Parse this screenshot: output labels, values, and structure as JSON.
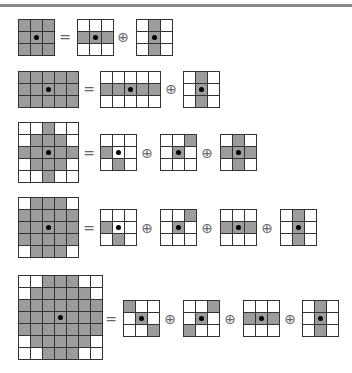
{
  "figure": {
    "colors": {
      "filled": "#9c9c9c",
      "empty": "#ffffff",
      "line": "#333333",
      "origin_dot": "#000000"
    },
    "operators": {
      "equals": "=",
      "dilation": "⊕"
    },
    "rows": [
      {
        "target": {
          "x": 18,
          "y": 19,
          "cols": 3,
          "rows": 3,
          "origin": [
            1,
            1
          ],
          "cells": [
            "111",
            "111",
            "111"
          ]
        },
        "equals_pos": [
          58,
          30
        ],
        "factors": [
          {
            "x": 77,
            "y": 19,
            "cols": 3,
            "rows": 3,
            "origin": [
              1,
              1
            ],
            "cells": [
              "000",
              "111",
              "000"
            ]
          },
          {
            "x": 136,
            "y": 19,
            "cols": 3,
            "rows": 3,
            "origin": [
              1,
              1
            ],
            "cells": [
              "010",
              "010",
              "010"
            ]
          }
        ],
        "op_pos": [
          [
            116,
            30
          ]
        ]
      },
      {
        "target": {
          "x": 18,
          "y": 71,
          "cols": 5,
          "rows": 3,
          "origin": [
            2,
            1
          ],
          "cells": [
            "11111",
            "11111",
            "11111"
          ]
        },
        "equals_pos": [
          82,
          82
        ],
        "factors": [
          {
            "x": 100,
            "y": 71,
            "cols": 5,
            "rows": 3,
            "origin": [
              2,
              1
            ],
            "cells": [
              "00000",
              "11111",
              "00000"
            ]
          },
          {
            "x": 183,
            "y": 71,
            "cols": 3,
            "rows": 3,
            "origin": [
              1,
              1
            ],
            "cells": [
              "010",
              "010",
              "010"
            ]
          }
        ],
        "op_pos": [
          [
            164,
            82
          ]
        ]
      },
      {
        "target": {
          "x": 18,
          "y": 122,
          "cols": 5,
          "rows": 5,
          "origin": [
            2,
            2
          ],
          "cells": [
            "00100",
            "01110",
            "11111",
            "01110",
            "00100"
          ]
        },
        "equals_pos": [
          82,
          146
        ],
        "factors": [
          {
            "x": 100,
            "y": 134,
            "cols": 3,
            "rows": 3,
            "origin": [
              1,
              1
            ],
            "cells": [
              "000",
              "100",
              "010"
            ],
            "origin_filled": false
          },
          {
            "x": 160,
            "y": 134,
            "cols": 3,
            "rows": 3,
            "origin": [
              1,
              1
            ],
            "cells": [
              "001",
              "010",
              "000"
            ]
          },
          {
            "x": 220,
            "y": 134,
            "cols": 3,
            "rows": 3,
            "origin": [
              1,
              1
            ],
            "cells": [
              "010",
              "111",
              "010"
            ]
          }
        ],
        "op_pos": [
          [
            140,
            146
          ],
          [
            200,
            146
          ]
        ]
      },
      {
        "target": {
          "x": 18,
          "y": 197,
          "cols": 5,
          "rows": 5,
          "origin": [
            2,
            2
          ],
          "cells": [
            "01110",
            "11111",
            "11111",
            "11111",
            "01110"
          ]
        },
        "equals_pos": [
          82,
          221
        ],
        "factors": [
          {
            "x": 100,
            "y": 209,
            "cols": 3,
            "rows": 3,
            "origin": [
              1,
              1
            ],
            "cells": [
              "000",
              "100",
              "010"
            ],
            "origin_filled": false
          },
          {
            "x": 160,
            "y": 209,
            "cols": 3,
            "rows": 3,
            "origin": [
              1,
              1
            ],
            "cells": [
              "001",
              "010",
              "000"
            ]
          },
          {
            "x": 220,
            "y": 209,
            "cols": 3,
            "rows": 3,
            "origin": [
              1,
              1
            ],
            "cells": [
              "000",
              "111",
              "000"
            ]
          },
          {
            "x": 280,
            "y": 209,
            "cols": 3,
            "rows": 3,
            "origin": [
              1,
              1
            ],
            "cells": [
              "010",
              "010",
              "010"
            ]
          }
        ],
        "op_pos": [
          [
            140,
            221
          ],
          [
            200,
            221
          ],
          [
            260,
            221
          ]
        ]
      },
      {
        "target": {
          "x": 18,
          "y": 275,
          "cols": 7,
          "rows": 7,
          "origin": [
            3,
            3
          ],
          "cells": [
            "0011100",
            "0111110",
            "1111111",
            "1111111",
            "1111111",
            "0111110",
            "0011100"
          ]
        },
        "equals_pos": [
          104,
          312
        ],
        "factors": [
          {
            "x": 123,
            "y": 300,
            "cols": 3,
            "rows": 3,
            "origin": [
              1,
              1
            ],
            "cells": [
              "100",
              "010",
              "001"
            ]
          },
          {
            "x": 183,
            "y": 300,
            "cols": 3,
            "rows": 3,
            "origin": [
              1,
              1
            ],
            "cells": [
              "001",
              "010",
              "100"
            ]
          },
          {
            "x": 243,
            "y": 300,
            "cols": 3,
            "rows": 3,
            "origin": [
              1,
              1
            ],
            "cells": [
              "000",
              "111",
              "000"
            ]
          },
          {
            "x": 302,
            "y": 300,
            "cols": 3,
            "rows": 3,
            "origin": [
              1,
              1
            ],
            "cells": [
              "010",
              "010",
              "010"
            ]
          }
        ],
        "op_pos": [
          [
            163,
            312
          ],
          [
            223,
            312
          ],
          [
            283,
            312
          ]
        ]
      }
    ]
  }
}
